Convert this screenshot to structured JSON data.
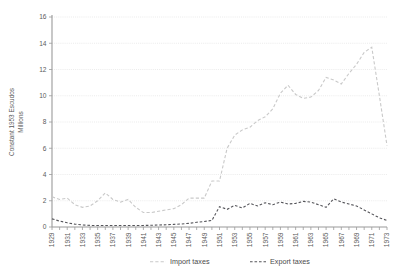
{
  "chart_data": {
    "type": "line",
    "title": "",
    "xlabel": "",
    "ylabel": "Constant 1953 Escudos Millions",
    "ylabel_lines": [
      "Constant 1953 Escudos",
      "Millions"
    ],
    "ylim": [
      0,
      16
    ],
    "xlim": [
      1929,
      1973
    ],
    "y_ticks": [
      0,
      2,
      4,
      6,
      8,
      10,
      12,
      14,
      16
    ],
    "y_tick_labels": [
      "0",
      "2",
      "4",
      "6",
      "8",
      "10",
      "12",
      "14",
      "16"
    ],
    "grid": true,
    "grid_axis": "y",
    "legend_position": "bottom",
    "x": [
      1929,
      1930,
      1931,
      1932,
      1933,
      1934,
      1935,
      1936,
      1937,
      1938,
      1939,
      1940,
      1941,
      1942,
      1943,
      1944,
      1945,
      1946,
      1947,
      1948,
      1949,
      1950,
      1951,
      1952,
      1953,
      1954,
      1955,
      1956,
      1957,
      1958,
      1959,
      1960,
      1961,
      1962,
      1963,
      1964,
      1965,
      1966,
      1967,
      1968,
      1969,
      1970,
      1971,
      1972,
      1973
    ],
    "x_tick_labels": [
      "1929",
      "1931",
      "1933",
      "1935",
      "1937",
      "1939",
      "1941",
      "1943",
      "1945",
      "1947",
      "1949",
      "1951",
      "1953",
      "1955",
      "1957",
      "1959",
      "1961",
      "1963",
      "1965",
      "1967",
      "1969",
      "1971",
      "1973"
    ],
    "series": [
      {
        "name": "Import taxes",
        "color": "#c9c9c9",
        "style": "dashed",
        "values": [
          2.3,
          2.1,
          2.2,
          1.7,
          1.5,
          1.6,
          2.0,
          2.6,
          2.1,
          1.9,
          2.1,
          1.5,
          1.1,
          1.1,
          1.2,
          1.3,
          1.4,
          1.7,
          2.2,
          2.2,
          2.2,
          3.5,
          3.5,
          6.0,
          7.0,
          7.4,
          7.6,
          8.1,
          8.4,
          9.0,
          10.2,
          10.8,
          10.1,
          9.8,
          9.9,
          10.4,
          11.4,
          11.2,
          10.9,
          11.7,
          12.4,
          13.3,
          13.7,
          10.0,
          6.2
        ]
      },
      {
        "name": "Export taxes",
        "color": "#55555a",
        "style": "dashed",
        "values": [
          0.62,
          0.45,
          0.32,
          0.22,
          0.16,
          0.12,
          0.11,
          0.11,
          0.12,
          0.11,
          0.12,
          0.11,
          0.12,
          0.13,
          0.15,
          0.17,
          0.2,
          0.23,
          0.28,
          0.36,
          0.42,
          0.5,
          1.55,
          1.35,
          1.65,
          1.45,
          1.8,
          1.6,
          1.85,
          1.7,
          1.9,
          1.75,
          1.8,
          1.95,
          1.9,
          1.7,
          1.5,
          2.15,
          1.9,
          1.75,
          1.6,
          1.3,
          1.0,
          0.7,
          0.5
        ]
      }
    ]
  },
  "legend": {
    "items": [
      {
        "label": "Import taxes"
      },
      {
        "label": "Export taxes"
      }
    ]
  }
}
